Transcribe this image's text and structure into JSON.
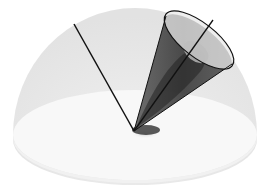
{
  "diagram": {
    "type": "hemisphere-cone-illustration",
    "colors": {
      "background": "#ffffff",
      "hemisphere_dome": "#e6e6e6",
      "hemisphere_base": "#f7f7f7",
      "cone_fill": "#3a3a3a",
      "cone_inner": "#cfcfcf",
      "line": "#111111"
    },
    "elements": {
      "hemisphere": {
        "center": [
          135,
          133
        ],
        "radius_x": 122,
        "dome_top_y": 8
      },
      "left_line": {
        "from": [
          134,
          131
        ],
        "to": [
          74,
          24
        ]
      },
      "cone": {
        "apex": [
          134,
          131
        ],
        "rim_center": [
          199,
          40
        ],
        "rim_rx": 42,
        "rim_ry": 17,
        "rim_rotation": 38
      },
      "cone_axis": {
        "from": [
          134,
          131
        ],
        "to": [
          213,
          20
        ]
      }
    }
  }
}
